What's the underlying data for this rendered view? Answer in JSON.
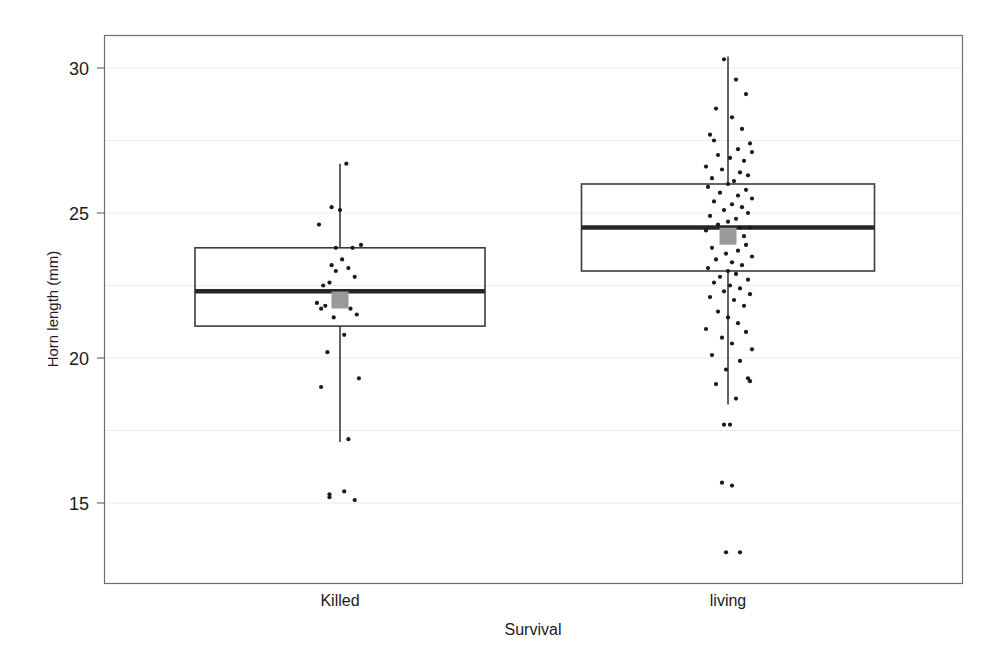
{
  "chart_data": {
    "type": "box",
    "title": "",
    "xlabel": "Survival",
    "ylabel": "Horn length (mm)",
    "categories": [
      "Killed",
      "living"
    ],
    "ylim": [
      12.5,
      31.3
    ],
    "yticks": [
      15,
      20,
      25,
      30
    ],
    "ytick_labels": [
      "15",
      "20",
      "25",
      "30"
    ],
    "grid": "horizontal-faint",
    "legend": "none",
    "overlay": "jittered raw data points (strip plot) over box plots; grey filled square marks the group mean",
    "boxes": [
      {
        "name": "Killed",
        "whisker_low": 17.1,
        "q1": 21.1,
        "median": 22.3,
        "q3": 23.8,
        "whisker_high": 26.7,
        "mean": 22.0,
        "n_points": 30
      },
      {
        "name": "living",
        "whisker_low": 18.4,
        "q1": 23.0,
        "median": 24.5,
        "q3": 26.0,
        "whisker_high": 30.4,
        "mean": 24.2,
        "n_points": 150
      }
    ],
    "points": {
      "Killed": [
        [
          0.03,
          26.7
        ],
        [
          -0.04,
          25.2
        ],
        [
          0.0,
          25.1
        ],
        [
          -0.1,
          24.6
        ],
        [
          -0.02,
          23.8
        ],
        [
          0.06,
          23.8
        ],
        [
          0.1,
          23.9
        ],
        [
          0.01,
          23.4
        ],
        [
          -0.04,
          23.2
        ],
        [
          0.04,
          23.1
        ],
        [
          -0.02,
          23.0
        ],
        [
          0.07,
          22.8
        ],
        [
          -0.05,
          22.6
        ],
        [
          -0.08,
          22.5
        ],
        [
          -0.11,
          21.9
        ],
        [
          -0.07,
          21.8
        ],
        [
          -0.09,
          21.7
        ],
        [
          0.05,
          21.7
        ],
        [
          0.08,
          21.5
        ],
        [
          -0.03,
          21.4
        ],
        [
          0.02,
          20.8
        ],
        [
          -0.06,
          20.2
        ],
        [
          0.09,
          19.3
        ],
        [
          -0.09,
          19.0
        ],
        [
          0.04,
          17.2
        ],
        [
          -0.05,
          15.3
        ],
        [
          -0.05,
          15.2
        ],
        [
          0.02,
          15.4
        ],
        [
          0.07,
          15.1
        ],
        [
          0.0,
          22.0
        ]
      ],
      "living": [
        [
          -0.02,
          30.3
        ],
        [
          0.04,
          29.6
        ],
        [
          0.09,
          29.1
        ],
        [
          -0.06,
          28.6
        ],
        [
          0.02,
          28.3
        ],
        [
          0.07,
          27.9
        ],
        [
          -0.09,
          27.7
        ],
        [
          -0.07,
          27.5
        ],
        [
          0.11,
          27.4
        ],
        [
          0.05,
          27.2
        ],
        [
          0.12,
          27.1
        ],
        [
          -0.05,
          27.0
        ],
        [
          0.01,
          26.9
        ],
        [
          0.08,
          26.8
        ],
        [
          -0.11,
          26.6
        ],
        [
          -0.03,
          26.5
        ],
        [
          0.06,
          26.4
        ],
        [
          0.1,
          26.3
        ],
        [
          -0.08,
          26.2
        ],
        [
          0.03,
          26.1
        ],
        [
          0.0,
          26.0
        ],
        [
          -0.1,
          25.9
        ],
        [
          0.09,
          25.8
        ],
        [
          -0.04,
          25.7
        ],
        [
          0.05,
          25.6
        ],
        [
          0.12,
          25.5
        ],
        [
          -0.07,
          25.4
        ],
        [
          0.02,
          25.3
        ],
        [
          0.07,
          25.2
        ],
        [
          -0.02,
          25.1
        ],
        [
          0.1,
          25.0
        ],
        [
          -0.09,
          24.9
        ],
        [
          0.04,
          24.8
        ],
        [
          0.0,
          24.7
        ],
        [
          -0.05,
          24.6
        ],
        [
          0.06,
          24.5
        ],
        [
          0.11,
          24.5
        ],
        [
          -0.11,
          24.4
        ],
        [
          0.01,
          24.3
        ],
        [
          0.08,
          24.2
        ],
        [
          -0.03,
          24.1
        ],
        [
          0.03,
          24.0
        ],
        [
          0.09,
          23.9
        ],
        [
          -0.08,
          23.8
        ],
        [
          0.05,
          23.7
        ],
        [
          -0.01,
          23.6
        ],
        [
          0.12,
          23.5
        ],
        [
          -0.06,
          23.4
        ],
        [
          0.02,
          23.3
        ],
        [
          0.07,
          23.2
        ],
        [
          -0.1,
          23.1
        ],
        [
          0.0,
          23.0
        ],
        [
          0.04,
          22.9
        ],
        [
          -0.04,
          22.8
        ],
        [
          0.1,
          22.7
        ],
        [
          -0.07,
          22.6
        ],
        [
          0.01,
          22.5
        ],
        [
          0.06,
          22.4
        ],
        [
          -0.02,
          22.3
        ],
        [
          0.11,
          22.2
        ],
        [
          -0.09,
          22.1
        ],
        [
          0.03,
          22.0
        ],
        [
          0.08,
          21.8
        ],
        [
          -0.05,
          21.6
        ],
        [
          0.0,
          21.4
        ],
        [
          0.05,
          21.2
        ],
        [
          -0.11,
          21.0
        ],
        [
          0.09,
          20.9
        ],
        [
          -0.03,
          20.7
        ],
        [
          0.02,
          20.5
        ],
        [
          0.12,
          20.3
        ],
        [
          -0.08,
          20.1
        ],
        [
          0.06,
          19.9
        ],
        [
          -0.01,
          19.6
        ],
        [
          0.1,
          19.3
        ],
        [
          -0.06,
          19.1
        ],
        [
          0.04,
          18.6
        ],
        [
          0.11,
          19.2
        ],
        [
          -0.02,
          17.7
        ],
        [
          0.01,
          17.7
        ],
        [
          -0.03,
          15.7
        ],
        [
          0.02,
          15.6
        ],
        [
          -0.01,
          13.3
        ],
        [
          0.06,
          13.3
        ]
      ]
    }
  },
  "axes": {
    "y_axis_title": "Horn length (mm)",
    "x_axis_title": "Survival",
    "y_tick_labels": [
      "30",
      "25",
      "20",
      "15"
    ],
    "x_tick_labels": [
      "Killed",
      "living"
    ]
  },
  "colors": {
    "frame": "#6e6e6e",
    "box_outline": "#3c3c3c",
    "median": "#262626",
    "whisker": "#3c3c3c",
    "point": "#1a1a1a",
    "mean_marker": "#9a9a9a",
    "grid": "#ececec",
    "background": "#ffffff",
    "text": "#1b1b1b"
  }
}
